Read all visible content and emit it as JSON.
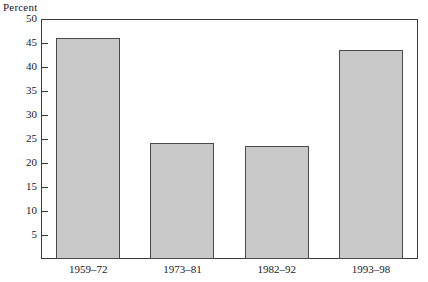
{
  "chart_data": {
    "type": "bar",
    "title": "",
    "ylabel": "Percent",
    "xlabel": "",
    "categories": [
      "1959–72",
      "1973–81",
      "1982–92",
      "1993–98"
    ],
    "values": [
      46.0,
      24.2,
      23.6,
      43.5
    ],
    "ylim": [
      0,
      50
    ],
    "yticks": [
      5,
      10,
      15,
      20,
      25,
      30,
      35,
      40,
      45,
      50
    ],
    "ytick_labels": [
      "5",
      "10",
      "15",
      "20",
      "25",
      "30",
      "35",
      "40",
      "45",
      "50"
    ],
    "grid": false,
    "legend": false,
    "bar_color": "#c9c9c9",
    "bar_border_color": "#4a4a4a",
    "axis_color": "#3a3a3a",
    "background": "#ffffff"
  }
}
